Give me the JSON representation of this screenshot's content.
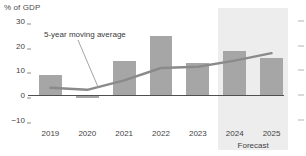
{
  "chart_data": {
    "type": "bar",
    "title": "% of GDP",
    "xlabel": "",
    "ylabel": "% of GDP",
    "ylim": [
      -10,
      32
    ],
    "yticks": [
      30,
      20,
      10,
      0,
      -10
    ],
    "ytick_labels": [
      "30",
      "20",
      "10",
      "0",
      "−10"
    ],
    "grid": false,
    "legend": "none",
    "categories": [
      "2019",
      "2020",
      "2021",
      "2022",
      "2023",
      "2024",
      "2025"
    ],
    "series": [
      {
        "name": "Annual value",
        "type": "bar",
        "color": "#a6a6a6",
        "values": [
          8,
          -1,
          14,
          24,
          13,
          18,
          15
        ]
      },
      {
        "name": "5-year moving average",
        "type": "line",
        "color": "#8a8a8a",
        "values": [
          3,
          2.2,
          6,
          11,
          11.5,
          14,
          17
        ]
      }
    ],
    "annotations": [
      {
        "text": "5-year moving average",
        "target_category": "2020"
      },
      {
        "text": "Forecast",
        "span": [
          "2024",
          "2025"
        ]
      }
    ],
    "shaded_regions": [
      {
        "label": "Forecast",
        "from": "2024",
        "to": "2025",
        "color": "#ededed"
      }
    ]
  },
  "axis": {
    "title": "% of GDP"
  },
  "annotation": {
    "moving_average": "5-year moving average",
    "forecast": "Forecast"
  }
}
